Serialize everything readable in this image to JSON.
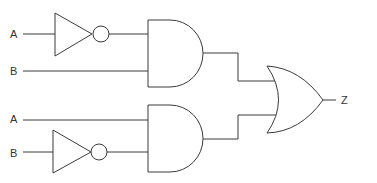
{
  "diagram": {
    "type": "logic-circuit",
    "inputs": [
      {
        "id": "in1",
        "label": "A"
      },
      {
        "id": "in2",
        "label": "B"
      },
      {
        "id": "in3",
        "label": "A"
      },
      {
        "id": "in4",
        "label": "B"
      }
    ],
    "output": {
      "label": "Z"
    },
    "gates": [
      {
        "id": "not1",
        "type": "NOT",
        "input": "A"
      },
      {
        "id": "and1",
        "type": "AND",
        "inputs": [
          "NOT A",
          "B"
        ]
      },
      {
        "id": "not2",
        "type": "NOT",
        "input": "B"
      },
      {
        "id": "and2",
        "type": "AND",
        "inputs": [
          "A",
          "NOT B"
        ]
      },
      {
        "id": "or1",
        "type": "OR",
        "inputs": [
          "and1",
          "and2"
        ],
        "output": "Z"
      }
    ],
    "colors": {
      "stroke": "#3a3a3a",
      "background": "#ffffff"
    }
  }
}
